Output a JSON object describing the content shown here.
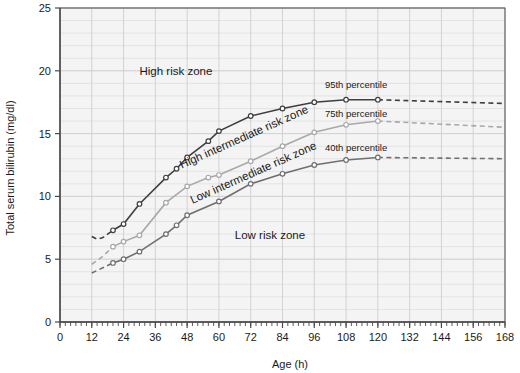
{
  "chart_data": {
    "type": "line",
    "title": "",
    "subtitle": "",
    "xlabel": "Age (h)",
    "ylabel": "Total serum bilirubin (mg/dl)",
    "xlim": [
      0,
      168
    ],
    "ylim": [
      0,
      25
    ],
    "x_ticks": [
      0,
      12,
      24,
      36,
      48,
      60,
      72,
      84,
      96,
      108,
      120,
      132,
      144,
      156,
      168
    ],
    "x_tick_labels": [
      "0",
      "12",
      "24",
      "36",
      "48",
      "60",
      "72",
      "84",
      "96",
      "108",
      "120",
      "132",
      "144",
      "156",
      "168"
    ],
    "x_minor_tick_step": 2,
    "y_ticks": [
      0,
      5,
      10,
      15,
      20,
      25
    ],
    "y_tick_labels": [
      "0",
      "5",
      "10",
      "15",
      "20",
      "25"
    ],
    "y_minor_gridline_step": 1,
    "x_major_gridline_step": 12,
    "grid": true,
    "legend_position": "inline-labels",
    "series": [
      {
        "name": "95th percentile",
        "label": "95th percentile",
        "color": "#3f3f3f",
        "marker": "circle-open",
        "label_x": 100,
        "label_y": 18.6,
        "solid_points": [
          {
            "x": 20,
            "y": 7.3
          },
          {
            "x": 24,
            "y": 7.8
          },
          {
            "x": 30,
            "y": 9.4
          },
          {
            "x": 40,
            "y": 11.5
          },
          {
            "x": 44,
            "y": 12.2
          },
          {
            "x": 48,
            "y": 13.1
          },
          {
            "x": 56,
            "y": 14.4
          },
          {
            "x": 60,
            "y": 15.2
          },
          {
            "x": 72,
            "y": 16.4
          },
          {
            "x": 84,
            "y": 17.0
          },
          {
            "x": 96,
            "y": 17.5
          },
          {
            "x": 108,
            "y": 17.7
          },
          {
            "x": 120,
            "y": 17.7
          }
        ],
        "dashed_head_points": [
          {
            "x": 12,
            "y": 6.8
          },
          {
            "x": 14,
            "y": 6.6
          },
          {
            "x": 16,
            "y": 6.7
          },
          {
            "x": 18,
            "y": 7.0
          },
          {
            "x": 20,
            "y": 7.3
          }
        ],
        "dashed_tail_points": [
          {
            "x": 120,
            "y": 17.7
          },
          {
            "x": 168,
            "y": 17.4
          }
        ]
      },
      {
        "name": "75th percentile",
        "label": "75th percentile",
        "color": "#a8a8a8",
        "marker": "circle-open",
        "label_x": 100,
        "label_y": 16.3,
        "solid_points": [
          {
            "x": 20,
            "y": 6.0
          },
          {
            "x": 24,
            "y": 6.4
          },
          {
            "x": 30,
            "y": 6.9
          },
          {
            "x": 40,
            "y": 9.5
          },
          {
            "x": 48,
            "y": 10.8
          },
          {
            "x": 56,
            "y": 11.5
          },
          {
            "x": 60,
            "y": 11.7
          },
          {
            "x": 72,
            "y": 12.8
          },
          {
            "x": 84,
            "y": 14.0
          },
          {
            "x": 96,
            "y": 15.1
          },
          {
            "x": 108,
            "y": 15.7
          },
          {
            "x": 120,
            "y": 16.0
          }
        ],
        "dashed_head_points": [
          {
            "x": 12,
            "y": 4.6
          },
          {
            "x": 16,
            "y": 5.2
          },
          {
            "x": 20,
            "y": 6.0
          }
        ],
        "dashed_tail_points": [
          {
            "x": 120,
            "y": 16.0
          },
          {
            "x": 168,
            "y": 15.5
          }
        ]
      },
      {
        "name": "40th percentile",
        "label": "40th percentile",
        "color": "#6f6f6f",
        "marker": "circle-open",
        "label_x": 100,
        "label_y": 13.6,
        "solid_points": [
          {
            "x": 20,
            "y": 4.7
          },
          {
            "x": 24,
            "y": 5.0
          },
          {
            "x": 30,
            "y": 5.6
          },
          {
            "x": 40,
            "y": 7.0
          },
          {
            "x": 44,
            "y": 7.7
          },
          {
            "x": 48,
            "y": 8.5
          },
          {
            "x": 60,
            "y": 9.6
          },
          {
            "x": 72,
            "y": 11.0
          },
          {
            "x": 84,
            "y": 11.8
          },
          {
            "x": 96,
            "y": 12.5
          },
          {
            "x": 108,
            "y": 12.9
          },
          {
            "x": 120,
            "y": 13.1
          }
        ],
        "dashed_head_points": [
          {
            "x": 12,
            "y": 3.9
          },
          {
            "x": 16,
            "y": 4.3
          },
          {
            "x": 20,
            "y": 4.7
          }
        ],
        "dashed_tail_points": [
          {
            "x": 120,
            "y": 13.1
          },
          {
            "x": 168,
            "y": 13.0
          }
        ]
      }
    ],
    "annotations": [
      {
        "name": "high-risk-zone",
        "text": "High risk zone",
        "x": 30,
        "y": 19.7,
        "rotation": 0
      },
      {
        "name": "low-risk-zone",
        "text": "Low risk zone",
        "x": 66,
        "y": 6.6,
        "rotation": 0
      },
      {
        "name": "high-intermediate-risk-zone",
        "text": "High intermediate risk zone",
        "x": 46,
        "y": 12.2,
        "rotation": -24
      },
      {
        "name": "low-intermediate-risk-zone",
        "text": "Low intermediate risk zone",
        "x": 50,
        "y": 9.4,
        "rotation": -24
      }
    ],
    "colors": {
      "plot_background": "#f4f4f4",
      "grid_minor": "#e3e3e3",
      "grid_major": "#d2d2d2",
      "axis": "#4a4a4a",
      "text": "#1a1a1a"
    }
  }
}
